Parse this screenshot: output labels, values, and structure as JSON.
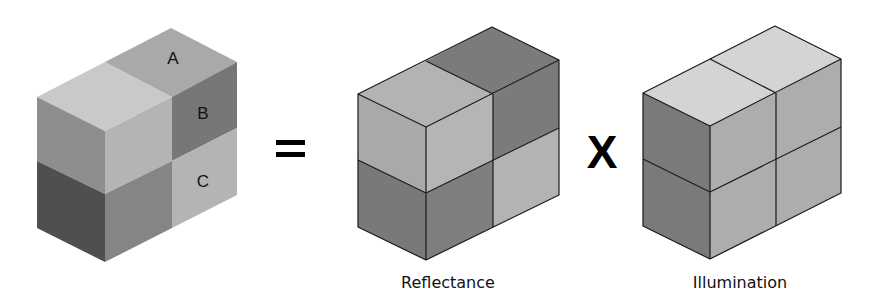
{
  "figure": {
    "left_block": {
      "labels": {
        "a": "A",
        "b": "B",
        "c": "C"
      },
      "colors": {
        "top_front": "#c9c9c9",
        "top_back_a": "#a9a9a9",
        "left_upper": "#8e8e8e",
        "front_right_upper": "#b4b4b4",
        "right_upper_b": "#777777",
        "right_lower_c": "#b4b4b4",
        "left_lower": "#4f4f4f",
        "front_right_lower": "#858585"
      }
    },
    "operators": {
      "equals": "=",
      "times": "X"
    },
    "reflectance_block": {
      "caption": "Reflectance",
      "colors": {
        "top_front": "#b3b3b3",
        "top_back": "#7b7b7b",
        "left_upper": "#a9a9a9",
        "front_right_upper": "#b5b5b5",
        "right_upper": "#7b7b7b",
        "left_lower": "#797979",
        "front_right_lower": "#7f7f7f",
        "right_lower": "#b3b3b3"
      }
    },
    "illumination_block": {
      "caption": "Illumination",
      "colors": {
        "top_front": "#d4d4d4",
        "top_back": "#d4d4d4",
        "left_upper": "#7a7a7a",
        "front_right_upper": "#adadad",
        "right_upper": "#adadad",
        "left_lower": "#7a7a7a",
        "front_right_lower": "#adadad",
        "right_lower": "#adadad"
      }
    }
  }
}
